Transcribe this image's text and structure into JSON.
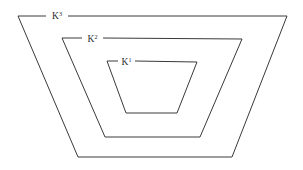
{
  "figure": {
    "name": "nested-trapezoid-regions",
    "background_color": "#ffffff",
    "stroke_color": "#3a3a3c",
    "text_color": "#2b2b2d",
    "width": 303,
    "height": 170
  },
  "regions": [
    {
      "id": "k3",
      "label_base": "K",
      "label_exponent": "3",
      "label_full": "K3",
      "label_x": 57,
      "label_y": 19,
      "path": "M 46 16 L 18 16 L 78 157 L 232 157 L 287 16 L 68 16",
      "order": "outer"
    },
    {
      "id": "k2",
      "label_base": "K",
      "label_exponent": "2",
      "label_full": "K2",
      "label_x": 92.5,
      "label_y": 42,
      "path": "M 82 38 L 62 38 L 105 137 L 200 137 L 242 39 L 103 38",
      "order": "middle"
    },
    {
      "id": "k1",
      "label_base": "K",
      "label_exponent": "1",
      "label_full": "K1",
      "label_x": 126.5,
      "label_y": 65,
      "path": "M 118 61 L 107 61 L 126 113 L 177 113 L 197 62 L 135 61",
      "order": "inner"
    }
  ]
}
